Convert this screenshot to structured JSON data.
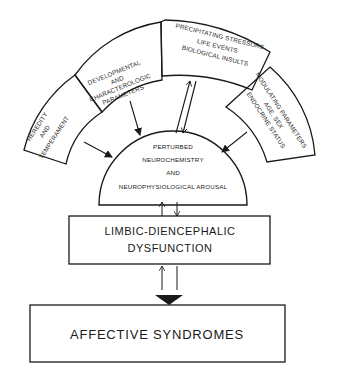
{
  "diagram": {
    "outer_ring": {
      "heredity": [
        "HEREDITY",
        "AND",
        "TEMPERAMENT"
      ],
      "developmental": [
        "DEVELOPMENTAL",
        "AND",
        "CHARACTEROLOGIC",
        "PARAMETERS"
      ],
      "precipitating": [
        "PRECIPITATING STRESSORS",
        "LIFE EVENTS",
        "BIOLOGICAL INSULTS"
      ],
      "modulating": [
        "MODULATING PARAMETERS",
        "AGE, SEX",
        "ENDOCRINE STATUS"
      ]
    },
    "core": [
      "PERTURBED",
      "NEUROCHEMISTRY",
      "AND",
      "NEUROPHYSIOLOGICAL AROUSAL"
    ],
    "limbic": [
      "LIMBIC-DIENCEPHALIC",
      "DYSFUNCTION"
    ],
    "outcome": "AFFECTIVE SYNDROMES",
    "colors": {
      "ink": "#1a1a1a",
      "background": "#ffffff"
    }
  }
}
